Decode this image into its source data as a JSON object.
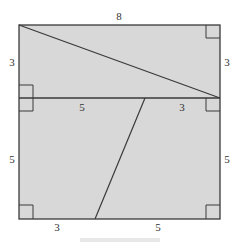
{
  "colors": {
    "fill": "#d8d8d8",
    "stroke": "#3a3a3a",
    "label": "#333333",
    "background": "#ffffff"
  },
  "figure": {
    "labels": {
      "top": "8",
      "left_upper": "3",
      "right_upper": "3",
      "middle_left": "5",
      "middle_right": "3",
      "left_lower": "5",
      "right_lower": "5",
      "bottom_left": "3",
      "bottom_right": "5"
    }
  }
}
